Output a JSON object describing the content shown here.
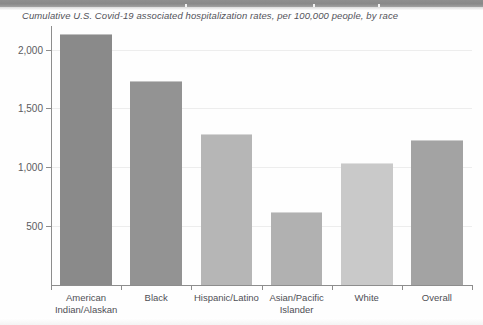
{
  "banner": {
    "present": true,
    "color": "#8f8f8f",
    "note": ""
  },
  "chart_data": {
    "type": "bar",
    "title": "Cumulative U.S. Covid-19 associated hospitalization rates, per 100,000 people, by race",
    "xlabel": "",
    "ylabel": "",
    "categories": [
      "American\nIndian/Alaskan",
      "Black",
      "Hispanic/Latino",
      "Asian/Pacific\nIslander",
      "White",
      "Overall"
    ],
    "values": [
      2130,
      1735,
      1285,
      620,
      1040,
      1230
    ],
    "bar_colors": [
      "#8a8a8a",
      "#939393",
      "#b6b6b6",
      "#b1b1b1",
      "#c9c9c9",
      "#a3a3a3"
    ],
    "ylim": [
      0,
      2200
    ],
    "yticks": [
      500,
      1000,
      1500,
      2000
    ],
    "ytick_labels": [
      "500",
      "1,000",
      "1,500",
      "2,000"
    ],
    "grid": true,
    "legend": "none"
  }
}
